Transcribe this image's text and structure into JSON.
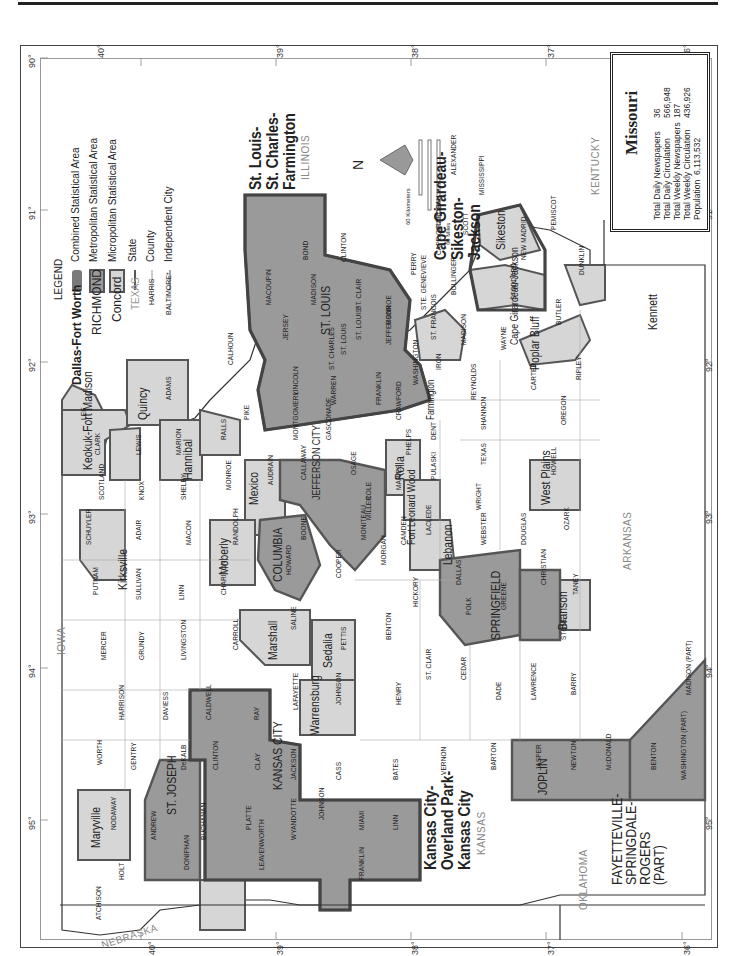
{
  "title": "Missouri",
  "stats": {
    "total_daily_newspapers_label": "Total Daily Newspapers",
    "total_daily_newspapers": "36",
    "total_daily_circulation_label": "Total Daily Circulation",
    "total_daily_circulation": "566,948",
    "total_weekly_newspapers_label": "Total Weekly Newspapers",
    "total_weekly_newspapers": "187",
    "total_weekly_circulation_label": "Total Weekly Circulation",
    "total_weekly_circulation": "436,926",
    "population_label": "Population",
    "population": "6,113,532"
  },
  "legend": {
    "heading": "LEGEND",
    "items": [
      {
        "sample": "Dallas-Fort Worth",
        "label": "Combined Statistical Area",
        "fill": "#8c8c8c"
      },
      {
        "sample": "RICHMOND",
        "label": "Metropolitan Statistical Area",
        "fill": "#a6a6a6"
      },
      {
        "sample": "Concord",
        "label": "Micropolitan Statistical Area",
        "fill": "#d4d4d4"
      },
      {
        "sample": "TEXAS",
        "label": "State"
      },
      {
        "sample": "HARRIS",
        "label": "County"
      },
      {
        "sample": "BALTIMORE*",
        "label": "Independent City"
      }
    ]
  },
  "scale": {
    "km_label": "60 Kilometers",
    "km_ticks": [
      "0",
      "15",
      "30",
      "45"
    ],
    "mi_label": "60 Miles",
    "mi_ticks": [
      "0",
      "15",
      "30",
      "45"
    ]
  },
  "north_label": "N",
  "latitude_ticks": [
    "40°",
    "39°",
    "38°",
    "37°",
    "36°"
  ],
  "longitude_ticks": [
    "95°",
    "94°",
    "93°",
    "92°",
    "91°",
    "90°",
    "89°",
    "88°"
  ],
  "states": {
    "iowa": "IOWA",
    "illinois": "ILLINOIS",
    "kentucky": "KENTUCKY",
    "arkansas": "ARKANSAS",
    "oklahoma": "OKLAHOMA",
    "kansas": "KANSAS",
    "nebraska": "NEBRASKA"
  },
  "csa_labels": {
    "st_louis": "St. Louis-\nSt. Charles-\nFarmington",
    "cape_girardeau": "Cape Girardeau-\nSikeston-\nJackson",
    "kansas_city": "Kansas City-\nOverland Park-\nKansas City",
    "fayetteville": "FAYETTEVILLE-\nSPRINGDALE-\nROGERS\n(PART)"
  },
  "metro_labels": {
    "st_louis": "ST. LOUIS",
    "kansas_city": "KANSAS CITY",
    "st_joseph": "ST. JOSEPH",
    "columbia": "COLUMBIA",
    "jefferson_city": "JEFFERSON CITY",
    "springfield": "SPRINGFIELD",
    "joplin": "JOPLIN"
  },
  "micro_labels": {
    "keokuk": "Keokuk-Fort Madison",
    "quincy": "Quincy",
    "hannibal": "Hannibal",
    "mexico": "Mexico",
    "moberly": "Moberly",
    "kirksville": "Kirksville",
    "marshall": "Marshall",
    "sedalia": "Sedalia",
    "warrensburg": "Warrensburg",
    "maryville": "Maryville",
    "rolla": "Rolla",
    "fort_leonard_wood": "Fort Leonard Wood",
    "lebanon": "Lebanon",
    "west_plains": "West Plains",
    "branson": "Branson",
    "poplar_bluff": "Poplar Bluff",
    "kennett": "Kennett",
    "sikeston": "Sikeston",
    "cape_girardeau_jackson": "Cape Girardeau-Jackson",
    "farmington": "Farmington"
  },
  "counties": [
    {
      "name": "ATCHISON",
      "x": 95,
      "y": 920
    },
    {
      "name": "HOLT",
      "x": 118,
      "y": 880
    },
    {
      "name": "NODAWAY",
      "x": 110,
      "y": 830
    },
    {
      "name": "ANDREW",
      "x": 150,
      "y": 840
    },
    {
      "name": "DONIPHAN",
      "x": 183,
      "y": 870
    },
    {
      "name": "BUCHANAN",
      "x": 200,
      "y": 840
    },
    {
      "name": "WORTH",
      "x": 96,
      "y": 765
    },
    {
      "name": "GENTRY",
      "x": 130,
      "y": 770
    },
    {
      "name": "DeKALB",
      "x": 180,
      "y": 770
    },
    {
      "name": "HARRISON",
      "x": 118,
      "y": 720
    },
    {
      "name": "DAVIESS",
      "x": 162,
      "y": 720
    },
    {
      "name": "CALDWELL",
      "x": 205,
      "y": 720
    },
    {
      "name": "CLINTON",
      "x": 212,
      "y": 770
    },
    {
      "name": "PLATTE",
      "x": 245,
      "y": 830
    },
    {
      "name": "LEAVENWORTH",
      "x": 258,
      "y": 870
    },
    {
      "name": "CLAY",
      "x": 254,
      "y": 770
    },
    {
      "name": "RAY",
      "x": 253,
      "y": 720
    },
    {
      "name": "WYANDOTTE",
      "x": 290,
      "y": 840
    },
    {
      "name": "JACKSON",
      "x": 290,
      "y": 780
    },
    {
      "name": "JOHNSON",
      "x": 318,
      "y": 820
    },
    {
      "name": "MIAMI",
      "x": 358,
      "y": 830
    },
    {
      "name": "LINN",
      "x": 392,
      "y": 830
    },
    {
      "name": "FRANKLIN",
      "x": 358,
      "y": 880
    },
    {
      "name": "CASS",
      "x": 335,
      "y": 780
    },
    {
      "name": "BATES",
      "x": 392,
      "y": 780
    },
    {
      "name": "LAFAYETTE",
      "x": 292,
      "y": 710
    },
    {
      "name": "JOHNSON",
      "x": 335,
      "y": 705
    },
    {
      "name": "MERCER",
      "x": 100,
      "y": 660
    },
    {
      "name": "GRUNDY",
      "x": 138,
      "y": 660
    },
    {
      "name": "LIVINGSTON",
      "x": 180,
      "y": 660
    },
    {
      "name": "CARROLL",
      "x": 232,
      "y": 650
    },
    {
      "name": "PUTNAM",
      "x": 92,
      "y": 595
    },
    {
      "name": "SULLIVAN",
      "x": 135,
      "y": 600
    },
    {
      "name": "LINN",
      "x": 178,
      "y": 600
    },
    {
      "name": "CHARITON",
      "x": 220,
      "y": 595
    },
    {
      "name": "SALINE",
      "x": 290,
      "y": 630
    },
    {
      "name": "SCHUYLER",
      "x": 85,
      "y": 545
    },
    {
      "name": "ADAIR",
      "x": 135,
      "y": 540
    },
    {
      "name": "MACON",
      "x": 185,
      "y": 545
    },
    {
      "name": "RANDOLPH",
      "x": 232,
      "y": 545
    },
    {
      "name": "HOWARD",
      "x": 285,
      "y": 575
    },
    {
      "name": "SCOTLAND",
      "x": 98,
      "y": 500
    },
    {
      "name": "KNOX",
      "x": 138,
      "y": 500
    },
    {
      "name": "SHELBY",
      "x": 180,
      "y": 500
    },
    {
      "name": "MONROE",
      "x": 225,
      "y": 490
    },
    {
      "name": "AUDRAIN",
      "x": 267,
      "y": 485
    },
    {
      "name": "BOONE",
      "x": 300,
      "y": 540
    },
    {
      "name": "CALLAWAY",
      "x": 300,
      "y": 480
    },
    {
      "name": "CLARK",
      "x": 94,
      "y": 455
    },
    {
      "name": "LEWIS",
      "x": 135,
      "y": 455
    },
    {
      "name": "MARION",
      "x": 175,
      "y": 455
    },
    {
      "name": "RALLS",
      "x": 220,
      "y": 440
    },
    {
      "name": "LEE",
      "x": 80,
      "y": 420
    },
    {
      "name": "ADAMS",
      "x": 165,
      "y": 400
    },
    {
      "name": "PIKE",
      "x": 243,
      "y": 420
    },
    {
      "name": "CALHOUN",
      "x": 227,
      "y": 365
    },
    {
      "name": "MONTGOMERY",
      "x": 292,
      "y": 440
    },
    {
      "name": "LINCOLN",
      "x": 292,
      "y": 395
    },
    {
      "name": "WARREN",
      "x": 330,
      "y": 405
    },
    {
      "name": "ST. CHARLES",
      "x": 328,
      "y": 370
    },
    {
      "name": "JERSEY",
      "x": 282,
      "y": 340
    },
    {
      "name": "MACOUPIN",
      "x": 265,
      "y": 305
    },
    {
      "name": "MADISON",
      "x": 310,
      "y": 305
    },
    {
      "name": "BOND",
      "x": 302,
      "y": 260
    },
    {
      "name": "CLINTON",
      "x": 340,
      "y": 262
    },
    {
      "name": "ST. CLAIR",
      "x": 355,
      "y": 310
    },
    {
      "name": "MONROE",
      "x": 385,
      "y": 325
    },
    {
      "name": "ST. LOUIS",
      "x": 340,
      "y": 355
    },
    {
      "name": "ST. LOUIS*",
      "x": 355,
      "y": 340
    },
    {
      "name": "JEFFERSON",
      "x": 385,
      "y": 345
    },
    {
      "name": "FRANKLIN",
      "x": 375,
      "y": 405
    },
    {
      "name": "GASCONADE",
      "x": 325,
      "y": 440
    },
    {
      "name": "OSAGE",
      "x": 350,
      "y": 475
    },
    {
      "name": "COLE",
      "x": 365,
      "y": 500
    },
    {
      "name": "MONITEAU",
      "x": 360,
      "y": 540
    },
    {
      "name": "COOPER",
      "x": 335,
      "y": 578
    },
    {
      "name": "MORGAN",
      "x": 380,
      "y": 565
    },
    {
      "name": "MILLER",
      "x": 365,
      "y": 520
    },
    {
      "name": "MARIES",
      "x": 395,
      "y": 490
    },
    {
      "name": "CAMDEN",
      "x": 400,
      "y": 545
    },
    {
      "name": "PETTIS",
      "x": 340,
      "y": 650
    },
    {
      "name": "BENTON",
      "x": 385,
      "y": 640
    },
    {
      "name": "HICKORY",
      "x": 412,
      "y": 607
    },
    {
      "name": "HENRY",
      "x": 395,
      "y": 705
    },
    {
      "name": "ST. CLAIR",
      "x": 425,
      "y": 680
    },
    {
      "name": "VERNON",
      "x": 440,
      "y": 775
    },
    {
      "name": "CEDAR",
      "x": 460,
      "y": 680
    },
    {
      "name": "BARTON",
      "x": 490,
      "y": 770
    },
    {
      "name": "DADE",
      "x": 495,
      "y": 700
    },
    {
      "name": "JASPER",
      "x": 535,
      "y": 770
    },
    {
      "name": "LAWRENCE",
      "x": 530,
      "y": 700
    },
    {
      "name": "NEWTON",
      "x": 570,
      "y": 770
    },
    {
      "name": "BARRY",
      "x": 570,
      "y": 695
    },
    {
      "name": "McDONALD",
      "x": 605,
      "y": 770
    },
    {
      "name": "BENTON",
      "x": 650,
      "y": 770
    },
    {
      "name": "WASHINGTON (PART)",
      "x": 680,
      "y": 780
    },
    {
      "name": "MADISON (PART)",
      "x": 685,
      "y": 695
    },
    {
      "name": "POLK",
      "x": 465,
      "y": 615
    },
    {
      "name": "DALLAS",
      "x": 455,
      "y": 585
    },
    {
      "name": "GREENE",
      "x": 500,
      "y": 610
    },
    {
      "name": "WEBSTER",
      "x": 480,
      "y": 545
    },
    {
      "name": "CHRISTIAN",
      "x": 540,
      "y": 585
    },
    {
      "name": "STONE",
      "x": 560,
      "y": 640
    },
    {
      "name": "TANEY",
      "x": 572,
      "y": 595
    },
    {
      "name": "LACLEDE",
      "x": 425,
      "y": 535
    },
    {
      "name": "PULASKI",
      "x": 430,
      "y": 480
    },
    {
      "name": "PHELPS",
      "x": 405,
      "y": 455
    },
    {
      "name": "CRAWFORD",
      "x": 395,
      "y": 420
    },
    {
      "name": "WRIGHT",
      "x": 475,
      "y": 510
    },
    {
      "name": "DOUGLAS",
      "x": 520,
      "y": 545
    },
    {
      "name": "OZARK",
      "x": 563,
      "y": 530
    },
    {
      "name": "TEXAS",
      "x": 480,
      "y": 465
    },
    {
      "name": "HOWELL",
      "x": 550,
      "y": 475
    },
    {
      "name": "DENT",
      "x": 430,
      "y": 440
    },
    {
      "name": "SHANNON",
      "x": 480,
      "y": 430
    },
    {
      "name": "OREGON",
      "x": 560,
      "y": 425
    },
    {
      "name": "CARTER",
      "x": 530,
      "y": 390
    },
    {
      "name": "RIPLEY",
      "x": 575,
      "y": 380
    },
    {
      "name": "REYNOLDS",
      "x": 470,
      "y": 400
    },
    {
      "name": "IRON",
      "x": 435,
      "y": 370
    },
    {
      "name": "WASHINGTON",
      "x": 412,
      "y": 385
    },
    {
      "name": "ST. FRANCOIS",
      "x": 430,
      "y": 340
    },
    {
      "name": "STE. GENEVIEVE",
      "x": 420,
      "y": 310
    },
    {
      "name": "PERRY",
      "x": 410,
      "y": 275
    },
    {
      "name": "MADISON",
      "x": 460,
      "y": 345
    },
    {
      "name": "WAYNE",
      "x": 500,
      "y": 350
    },
    {
      "name": "BOLLINGER",
      "x": 450,
      "y": 295
    },
    {
      "name": "CAPE GIRARDEAU",
      "x": 435,
      "y": 255
    },
    {
      "name": "SCOTT",
      "x": 462,
      "y": 235
    },
    {
      "name": "ALEXANDER",
      "x": 450,
      "y": 175
    },
    {
      "name": "MISSISSIPPI",
      "x": 478,
      "y": 195
    },
    {
      "name": "STODDARD",
      "x": 510,
      "y": 300
    },
    {
      "name": "BUTLER",
      "x": 555,
      "y": 325
    },
    {
      "name": "NEW MADRID",
      "x": 520,
      "y": 260
    },
    {
      "name": "PEMISCOT",
      "x": 550,
      "y": 230
    },
    {
      "name": "DUNKLIN",
      "x": 578,
      "y": 275
    }
  ]
}
